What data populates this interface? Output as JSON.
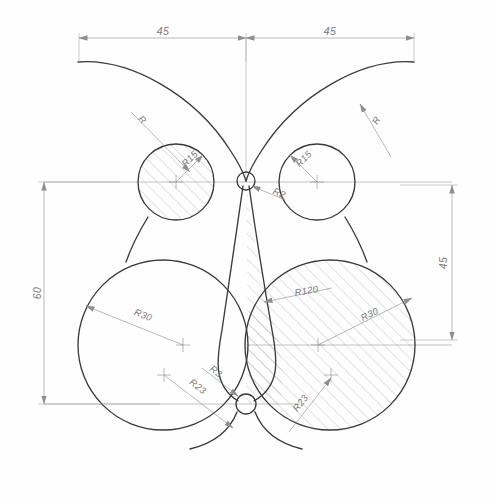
{
  "drawing": {
    "title": "Butterfly profile technical drawing",
    "background_color": "#fefefe",
    "outline_color": "#3a3a3a",
    "dimension_color": "#8f8f8f",
    "hatch_color": "#9b9b9b"
  },
  "dimensions": {
    "top_left": "45",
    "top_right": "45",
    "left_vertical": "60",
    "right_vertical": "45"
  },
  "radii": {
    "upper_left_arc": "R",
    "upper_right_arc": "R",
    "left_small_circle": "R15",
    "right_small_circle": "R15",
    "center_fillet": "R2",
    "left_large_circle": "R30",
    "right_large_circle": "R30",
    "inner_spine": "R120",
    "bottom_fillet": "R3",
    "left_bottom_arc": "R23",
    "right_bottom_arc": "R23"
  },
  "centers": {
    "left_small": {
      "x": 176,
      "y": 182
    },
    "right_small": {
      "x": 317,
      "y": 182
    },
    "left_large": {
      "x": 163,
      "y": 345
    },
    "right_large": {
      "x": 330,
      "y": 345
    },
    "left_aux": {
      "x": 163,
      "y": 375
    },
    "right_aux": {
      "x": 330,
      "y": 375
    },
    "center_top": {
      "x": 246,
      "y": 181
    },
    "center_bottom": {
      "x": 246,
      "y": 404
    }
  }
}
